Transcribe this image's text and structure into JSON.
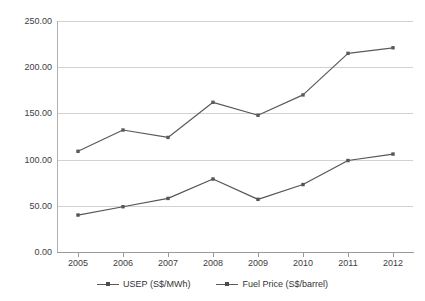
{
  "chart_data": {
    "type": "line",
    "title": "",
    "xlabel": "",
    "ylabel": "",
    "categories": [
      "2005",
      "2006",
      "2007",
      "2008",
      "2009",
      "2010",
      "2011",
      "2012"
    ],
    "ylim": [
      0,
      250
    ],
    "ytick_labels": [
      "0.00",
      "50.00",
      "100.00",
      "150.00",
      "200.00",
      "250.00"
    ],
    "ytick_values": [
      0,
      50,
      100,
      150,
      200,
      250
    ],
    "grid": true,
    "legend_position": "bottom",
    "series": [
      {
        "name": "USEP (S$/MWh)",
        "values": [
          109,
          132,
          124,
          162,
          148,
          170,
          215,
          221
        ],
        "color": "#5a5a5a",
        "marker": "square"
      },
      {
        "name": "Fuel Price (S$/barrel)",
        "values": [
          40,
          49,
          58,
          79,
          57,
          73,
          99,
          106
        ],
        "color": "#555555",
        "marker": "square"
      }
    ]
  },
  "legend": {
    "items": [
      {
        "label": "USEP (S$/MWh)"
      },
      {
        "label": "Fuel Price (S$/barrel)"
      }
    ]
  }
}
